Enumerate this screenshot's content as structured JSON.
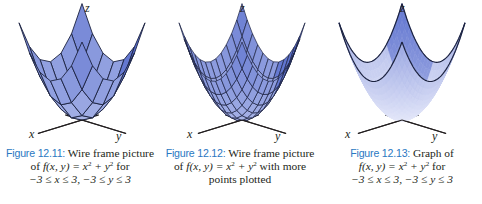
{
  "figures": [
    {
      "id": "12.11",
      "label": "Figure 12.11:",
      "caption_lines": [
        "Wire frame picture",
        "of f(x, y) = x² + y² for",
        "−3 ≤ x ≤ 3, −3 ≤ y ≤ 3"
      ],
      "caption_parts": {
        "line1": " Wire frame picture",
        "of": "of ",
        "func": "f",
        "args": "(x, y) = x",
        "plus": " + y",
        "tail": " for",
        "domain": "−3 ≤ x ≤ 3, −3 ≤ y ≤ 3"
      },
      "style": "wireframe-coarse",
      "grid_n": 6,
      "axes": {
        "x": "x",
        "y": "y",
        "z": "z"
      }
    },
    {
      "id": "12.12",
      "label": "Figure 12.12:",
      "caption_parts": {
        "line1": " Wire frame picture",
        "of": "of ",
        "func": "f",
        "args": "(x, y) = x",
        "plus": " + y",
        "tail": " with more",
        "line3": "points plotted"
      },
      "style": "wireframe-fine",
      "grid_n": 12,
      "axes": {
        "x": "x",
        "y": "y",
        "z": "z"
      }
    },
    {
      "id": "12.13",
      "label": "Figure 12.13:",
      "caption_parts": {
        "line1": " Graph of",
        "func": "f",
        "args": "(x, y) = x",
        "plus": " + y",
        "tail": " for",
        "domain": "−3 ≤ x ≤ 3, −3 ≤ y ≤ 3"
      },
      "style": "smooth-surface",
      "grid_n": 24,
      "axes": {
        "x": "x",
        "y": "y",
        "z": "z"
      }
    }
  ],
  "surface": {
    "function": "f(x, y) = x^2 + y^2",
    "x_range": [
      -3,
      3
    ],
    "y_range": [
      -3,
      3
    ]
  },
  "colors": {
    "figure_label": "#2a78c2",
    "surface_light": "#c9d1f2",
    "surface_mid": "#8e9ee2",
    "surface_dark": "#4c63c9",
    "mesh_line": "#1c2340",
    "axis_line": "#231f20"
  }
}
